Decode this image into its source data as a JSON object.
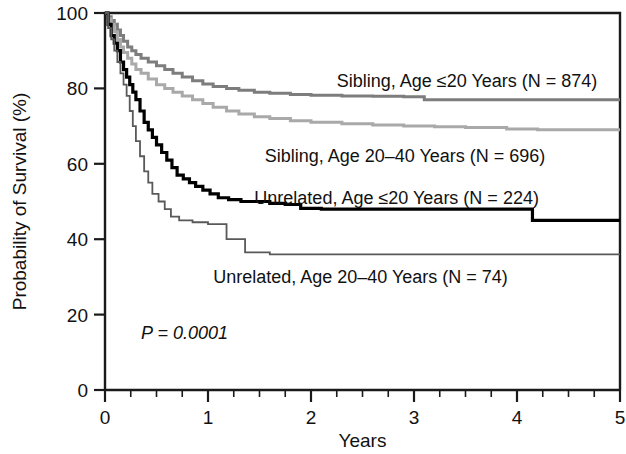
{
  "chart_data": {
    "type": "line",
    "subtype": "kaplan-meier-survival",
    "title": "",
    "xlabel": "Years",
    "ylabel": "Probability of Survival (%)",
    "xlim": [
      0,
      5
    ],
    "ylim": [
      0,
      100
    ],
    "grid": false,
    "legend_position": "inline-right-of-curves",
    "x_ticks": [
      0,
      1,
      2,
      3,
      4,
      5
    ],
    "x_tick_labels": [
      "0",
      "1",
      "2",
      "3",
      "4",
      "5"
    ],
    "x_minor_tick_interval": 0.25,
    "y_ticks": [
      0,
      20,
      40,
      60,
      80,
      100
    ],
    "y_tick_labels": [
      "0",
      "20",
      "40",
      "60",
      "80",
      "100"
    ],
    "annotations": [
      {
        "name": "p-value",
        "text": "P = 0.0001",
        "x": 0.35,
        "y": 15,
        "style": "italic"
      }
    ],
    "series": [
      {
        "name": "Sibling, Age ≤20 Years (N = 874)",
        "label": "Sibling, Age ≤20 Years (N = 874)",
        "n": 874,
        "color": "#7d7d7d",
        "width": 3.0,
        "label_x": 2.25,
        "label_y": 82,
        "final_value": 77,
        "points": [
          [
            0.0,
            100
          ],
          [
            0.03,
            99
          ],
          [
            0.06,
            98
          ],
          [
            0.09,
            97
          ],
          [
            0.12,
            95.5
          ],
          [
            0.15,
            94
          ],
          [
            0.18,
            92.5
          ],
          [
            0.22,
            91
          ],
          [
            0.26,
            90
          ],
          [
            0.3,
            89
          ],
          [
            0.35,
            88
          ],
          [
            0.42,
            87
          ],
          [
            0.5,
            86
          ],
          [
            0.58,
            85
          ],
          [
            0.66,
            84
          ],
          [
            0.75,
            83
          ],
          [
            0.85,
            82
          ],
          [
            0.95,
            81.2
          ],
          [
            1.05,
            80.5
          ],
          [
            1.18,
            80
          ],
          [
            1.3,
            79.5
          ],
          [
            1.45,
            79
          ],
          [
            1.6,
            78.7
          ],
          [
            1.8,
            78.4
          ],
          [
            2.0,
            78.2
          ],
          [
            2.3,
            78.0
          ],
          [
            2.6,
            77.9
          ],
          [
            2.9,
            77.8
          ],
          [
            3.1,
            77.0
          ],
          [
            3.5,
            77.0
          ],
          [
            4.0,
            77.0
          ],
          [
            4.5,
            77.0
          ],
          [
            5.0,
            77.0
          ]
        ]
      },
      {
        "name": "Sibling, Age 20–40 Years (N = 696)",
        "label": "Sibling, Age 20–40 Years (N = 696)",
        "n": 696,
        "color": "#a9a9a9",
        "width": 3.0,
        "label_x": 1.55,
        "label_y": 62,
        "final_value": 69,
        "points": [
          [
            0.0,
            100
          ],
          [
            0.03,
            98.5
          ],
          [
            0.06,
            97
          ],
          [
            0.09,
            95
          ],
          [
            0.12,
            93
          ],
          [
            0.15,
            91
          ],
          [
            0.18,
            89.5
          ],
          [
            0.22,
            88
          ],
          [
            0.26,
            86.5
          ],
          [
            0.3,
            85
          ],
          [
            0.35,
            84
          ],
          [
            0.42,
            82.5
          ],
          [
            0.5,
            81
          ],
          [
            0.58,
            80
          ],
          [
            0.66,
            79
          ],
          [
            0.75,
            78
          ],
          [
            0.85,
            77
          ],
          [
            0.95,
            76
          ],
          [
            1.05,
            75
          ],
          [
            1.18,
            74
          ],
          [
            1.3,
            73.2
          ],
          [
            1.45,
            72.5
          ],
          [
            1.6,
            72
          ],
          [
            1.8,
            71.4
          ],
          [
            2.0,
            71
          ],
          [
            2.3,
            70.6
          ],
          [
            2.6,
            70.3
          ],
          [
            2.9,
            70.0
          ],
          [
            3.2,
            69.8
          ],
          [
            3.5,
            69.6
          ],
          [
            3.9,
            69.2
          ],
          [
            4.2,
            69.0
          ],
          [
            4.6,
            69.0
          ],
          [
            5.0,
            69.0
          ]
        ]
      },
      {
        "name": "Unrelated, Age ≤20 Years (N = 224)",
        "label": "Unrelated, Age ≤20 Years (N = 224)",
        "n": 224,
        "color": "#000000",
        "width": 3.2,
        "label_x": 1.45,
        "label_y": 51,
        "final_value": 45,
        "points": [
          [
            0.0,
            100
          ],
          [
            0.03,
            97
          ],
          [
            0.06,
            94
          ],
          [
            0.09,
            92
          ],
          [
            0.12,
            90
          ],
          [
            0.15,
            87
          ],
          [
            0.18,
            85
          ],
          [
            0.21,
            83
          ],
          [
            0.24,
            81
          ],
          [
            0.27,
            79
          ],
          [
            0.3,
            77
          ],
          [
            0.34,
            74
          ],
          [
            0.38,
            71
          ],
          [
            0.42,
            69
          ],
          [
            0.46,
            67
          ],
          [
            0.5,
            65
          ],
          [
            0.55,
            63
          ],
          [
            0.6,
            61
          ],
          [
            0.65,
            59
          ],
          [
            0.7,
            57
          ],
          [
            0.76,
            56
          ],
          [
            0.82,
            55
          ],
          [
            0.88,
            54
          ],
          [
            0.95,
            53
          ],
          [
            1.02,
            52
          ],
          [
            1.1,
            51
          ],
          [
            1.2,
            50.5
          ],
          [
            1.32,
            50
          ],
          [
            1.45,
            50
          ],
          [
            1.6,
            49.5
          ],
          [
            1.75,
            49.2
          ],
          [
            1.9,
            48.2
          ],
          [
            2.1,
            48.0
          ],
          [
            2.5,
            48.0
          ],
          [
            3.0,
            48.0
          ],
          [
            3.5,
            48.0
          ],
          [
            4.0,
            48.0
          ],
          [
            4.15,
            45.0
          ],
          [
            4.5,
            45.0
          ],
          [
            5.0,
            45.0
          ]
        ]
      },
      {
        "name": "Unrelated, Age 20–40 Years (N = 74)",
        "label": "Unrelated, Age 20–40 Years (N = 74)",
        "n": 74,
        "color": "#595959",
        "width": 1.8,
        "label_x": 1.05,
        "label_y": 30,
        "final_value": 36,
        "points": [
          [
            0.0,
            100
          ],
          [
            0.03,
            96
          ],
          [
            0.06,
            93
          ],
          [
            0.09,
            90
          ],
          [
            0.12,
            87
          ],
          [
            0.15,
            84
          ],
          [
            0.18,
            81
          ],
          [
            0.21,
            78
          ],
          [
            0.24,
            74
          ],
          [
            0.27,
            70
          ],
          [
            0.3,
            66
          ],
          [
            0.34,
            62
          ],
          [
            0.38,
            58
          ],
          [
            0.42,
            55
          ],
          [
            0.46,
            52
          ],
          [
            0.52,
            50
          ],
          [
            0.58,
            48
          ],
          [
            0.64,
            46
          ],
          [
            0.72,
            45
          ],
          [
            0.85,
            44.5
          ],
          [
            1.0,
            44
          ],
          [
            1.12,
            44
          ],
          [
            1.18,
            40
          ],
          [
            1.3,
            40
          ],
          [
            1.36,
            36.5
          ],
          [
            1.6,
            36.0
          ],
          [
            2.0,
            36.0
          ],
          [
            2.5,
            36.0
          ],
          [
            3.0,
            36.0
          ],
          [
            3.5,
            36.0
          ],
          [
            4.0,
            36.0
          ],
          [
            4.5,
            36.0
          ],
          [
            5.0,
            36.0
          ]
        ]
      }
    ]
  }
}
